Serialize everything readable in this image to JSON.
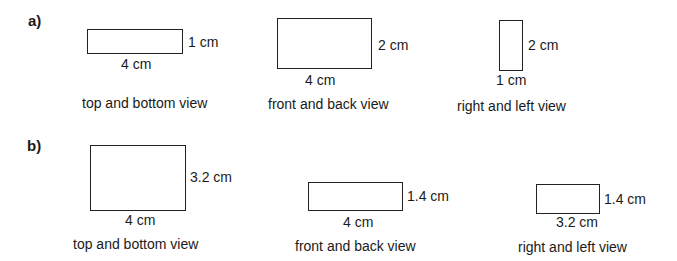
{
  "parts": [
    {
      "label": "a)",
      "views": [
        {
          "caption": "top and bottom view",
          "width_label": "4 cm",
          "height_label": "1 cm"
        },
        {
          "caption": "front and back view",
          "width_label": "4 cm",
          "height_label": "2 cm"
        },
        {
          "caption": "right and left view",
          "width_label": "1 cm",
          "height_label": "2 cm"
        }
      ]
    },
    {
      "label": "b)",
      "views": [
        {
          "caption": "top and bottom view",
          "width_label": "4 cm",
          "height_label": "3.2 cm"
        },
        {
          "caption": "front and back view",
          "width_label": "4 cm",
          "height_label": "1.4 cm"
        },
        {
          "caption": "right and left view",
          "width_label": "3.2 cm",
          "height_label": "1.4 cm"
        }
      ]
    }
  ]
}
